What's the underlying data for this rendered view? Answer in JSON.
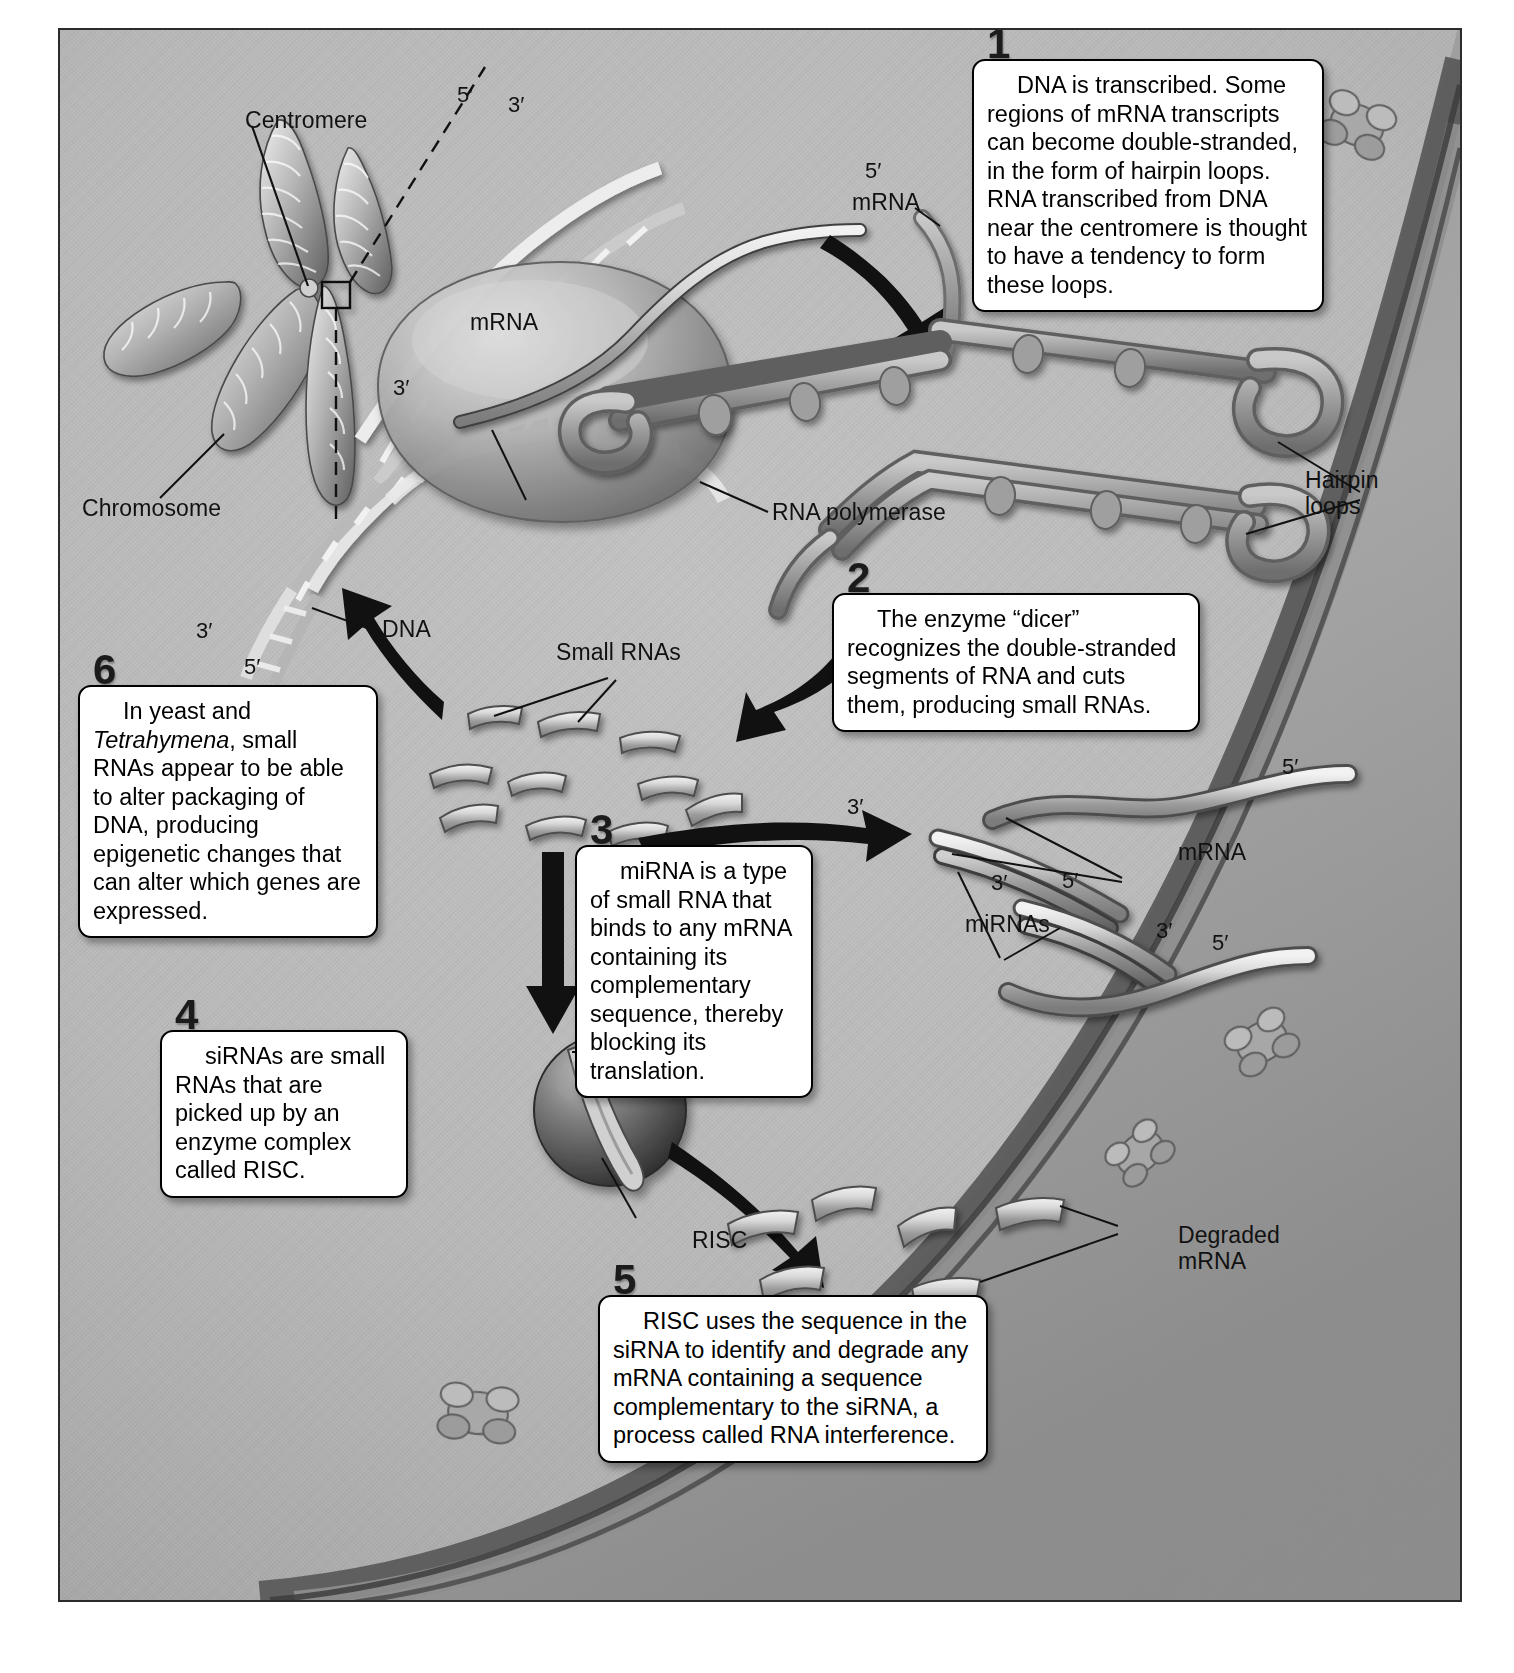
{
  "figure": {
    "background_color": "#b5b5b5",
    "border_color": "#2b2b2b"
  },
  "callouts": [
    {
      "number": "1",
      "text": "DNA is transcribed. Some regions of mRNA transcripts can become double-stranded, in the form of hairpin loops. RNA transcribed from DNA near the centromere is thought to have a tendency to form these loops."
    },
    {
      "number": "2",
      "text": "The enzyme “dicer” recognizes the double-stranded segments of RNA and cuts them, producing small RNAs."
    },
    {
      "number": "3",
      "text": "miRNA is a type of small RNA that binds to any mRNA containing its complementary sequence, thereby blocking its translation."
    },
    {
      "number": "4",
      "text": "siRNAs are small RNAs that are picked up by an enzyme complex called RISC."
    },
    {
      "number": "5",
      "text": "RISC uses the sequence in the siRNA to identify and degrade any mRNA containing a sequence complementary to the siRNA, a process called RNA interference."
    },
    {
      "number": "6",
      "text_before": "In yeast and ",
      "text_italic": "Tetrahymena",
      "text_after": ", small RNAs appear to be able to alter packaging of DNA, producing epigenetic changes that can alter which genes are expressed."
    }
  ],
  "labels": {
    "centromere": "Centromere",
    "chromosome": "Chromosome",
    "mrna_transcript": "mRNA",
    "rna_polymerase": "RNA polymerase",
    "dna": "DNA",
    "mrna_hairpin": "mRNA",
    "hairpin_loops": "Hairpin\nloops",
    "small_rnas": "Small RNAs",
    "mrna_pair": "mRNA",
    "mirnas": "miRNAs",
    "sirna": "siRNA",
    "risc": "RISC",
    "degraded_mrna": "Degraded\nmRNA"
  },
  "primes": {
    "dna_top_5": "5′",
    "dna_top_3": "3′",
    "mrna_transcript_5": "5′",
    "polymerase_3": "3′",
    "dna_bottom_3": "3′",
    "dna_bottom_5": "5′",
    "mirna_top_3": "3′",
    "mirna_top_5": "5′",
    "mrna_upper_3": "3′",
    "mrna_upper_5": "5′",
    "mirna_mid_3": "3′",
    "mirna_mid_5": "5′",
    "mirna_low_3": "3′",
    "mrna_low_5": "5′"
  }
}
